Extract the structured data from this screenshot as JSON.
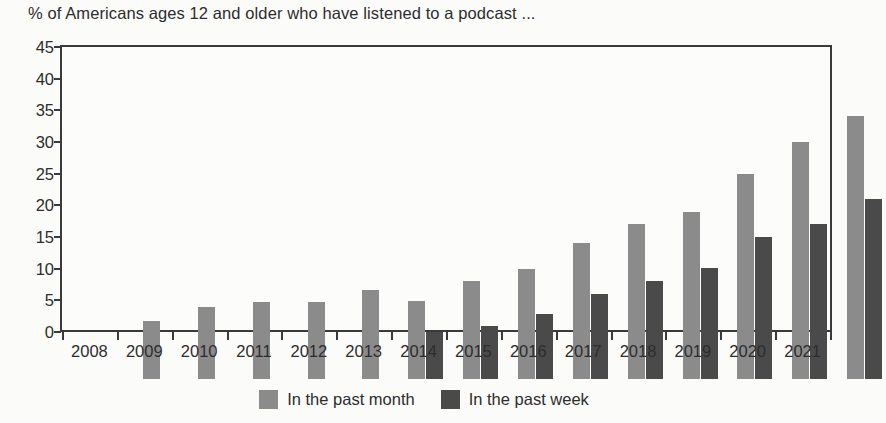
{
  "chart_data": {
    "type": "bar",
    "title": "% of Americans ages 12 and older who have listened to a podcast ...",
    "xlabel": "",
    "ylabel": "",
    "ylim": [
      0,
      45
    ],
    "yticks": [
      0,
      5,
      10,
      15,
      20,
      25,
      30,
      35,
      40,
      45
    ],
    "ytick_labels": [
      "0",
      "5",
      "10",
      "15",
      "20",
      "25",
      "30",
      "35",
      "40",
      "45"
    ],
    "grid": false,
    "legend_position": "bottom-center",
    "categories": [
      "2008",
      "2009",
      "2010",
      "2011",
      "2012",
      "2013",
      "2014",
      "2015",
      "2016",
      "2017",
      "2018",
      "2019",
      "2020",
      "2021"
    ],
    "series": [
      {
        "name": "In the past month",
        "color": "#8b8b8b",
        "values": [
          9.2,
          11.3,
          12.1,
          12.1,
          14.1,
          12.3,
          15.4,
          17.4,
          21.5,
          24.4,
          26.4,
          32.4,
          37.5,
          41.5
        ]
      },
      {
        "name": "In the past week",
        "color": "#4a4a4a",
        "values": [
          null,
          null,
          null,
          null,
          null,
          7.4,
          8.3,
          10.3,
          13.5,
          15.4,
          17.5,
          22.4,
          24.5,
          28.5
        ]
      }
    ]
  },
  "legend": {
    "items": [
      {
        "label": "In the past month",
        "color": "#8b8b8b",
        "swatch_name": "legend-swatch-month"
      },
      {
        "label": "In the past week",
        "color": "#4a4a4a",
        "swatch_name": "legend-swatch-week"
      }
    ]
  }
}
